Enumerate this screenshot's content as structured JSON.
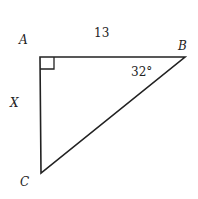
{
  "diagram": {
    "type": "right-triangle",
    "vertices": {
      "A": {
        "label": "A",
        "x": 40,
        "y": 57
      },
      "B": {
        "label": "B",
        "x": 185,
        "y": 57
      },
      "C": {
        "label": "C",
        "x": 41,
        "y": 173
      }
    },
    "right_angle_at": "A",
    "side_AB_label": "13",
    "side_AC_label": "X",
    "angle_B_label": "32°",
    "stroke_color": "#222222"
  }
}
